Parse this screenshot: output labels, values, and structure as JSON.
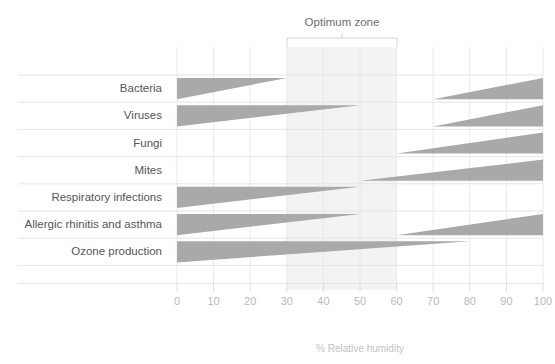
{
  "chart_data": {
    "type": "area",
    "title": "",
    "xlabel": "% Relative humidity",
    "ylabel": "",
    "xlim": [
      0,
      100
    ],
    "xticks": [
      0,
      10,
      20,
      30,
      40,
      50,
      60,
      70,
      80,
      90,
      100
    ],
    "xtick_labels": [
      "0",
      "10",
      "20",
      "30",
      "40",
      "50",
      "60",
      "70",
      "80",
      "90",
      "100"
    ],
    "grid": true,
    "legend": "none",
    "annotations": [
      {
        "name": "optimum-zone",
        "label": "Optimum zone",
        "x_start": 30,
        "x_end": 60,
        "shaded": true
      }
    ],
    "categories": [
      "Bacteria",
      "Viruses",
      "Fungi",
      "Mites",
      "Respiratory infections",
      "Allergic rhinitis and asthma",
      "Ozone production"
    ],
    "series": [
      {
        "name": "Bacteria",
        "bands": [
          {
            "from": 0,
            "to": 30,
            "thickness_from": 1.0,
            "thickness_to": 0.0,
            "side": "top"
          },
          {
            "from": 70,
            "to": 100,
            "thickness_from": 0.0,
            "thickness_to": 1.0,
            "side": "bottom"
          }
        ]
      },
      {
        "name": "Viruses",
        "bands": [
          {
            "from": 0,
            "to": 50,
            "thickness_from": 1.0,
            "thickness_to": 0.0,
            "side": "top"
          },
          {
            "from": 70,
            "to": 100,
            "thickness_from": 0.0,
            "thickness_to": 1.0,
            "side": "bottom"
          }
        ]
      },
      {
        "name": "Fungi",
        "bands": [
          {
            "from": 60,
            "to": 100,
            "thickness_from": 0.0,
            "thickness_to": 1.0,
            "side": "bottom"
          }
        ]
      },
      {
        "name": "Mites",
        "bands": [
          {
            "from": 50,
            "to": 100,
            "thickness_from": 0.0,
            "thickness_to": 1.0,
            "side": "bottom"
          }
        ]
      },
      {
        "name": "Respiratory infections",
        "bands": [
          {
            "from": 0,
            "to": 50,
            "thickness_from": 1.0,
            "thickness_to": 0.0,
            "side": "top"
          }
        ]
      },
      {
        "name": "Allergic rhinitis and asthma",
        "bands": [
          {
            "from": 0,
            "to": 50,
            "thickness_from": 1.0,
            "thickness_to": 0.0,
            "side": "top"
          },
          {
            "from": 60,
            "to": 100,
            "thickness_from": 0.0,
            "thickness_to": 1.0,
            "side": "bottom"
          }
        ]
      },
      {
        "name": "Ozone production",
        "bands": [
          {
            "from": 0,
            "to": 80,
            "thickness_from": 1.0,
            "thickness_to": 0.0,
            "side": "top"
          }
        ]
      }
    ]
  },
  "labels": {
    "row_0": "Bacteria",
    "row_1": "Viruses",
    "row_2": "Fungi",
    "row_3": "Mites",
    "row_4": "Respiratory infections",
    "row_5": "Allergic rhinitis and asthma",
    "row_6": "Ozone production"
  },
  "axis": {
    "title": "% Relative humidity",
    "ticks": [
      "0",
      "10",
      "20",
      "30",
      "40",
      "50",
      "60",
      "70",
      "80",
      "90",
      "100"
    ]
  },
  "zone": {
    "label": "Optimum zone",
    "range_start": "30",
    "range_end": "60"
  },
  "colors": {
    "wedge": "#a9a9a9",
    "zone_band": "#f3f3f3",
    "grid": "#e9e9e9",
    "row_line": "#e6e6e6",
    "label_text": "#555555",
    "tick_text": "#b9b9b9",
    "axis_title_text": "#c2c2c2",
    "zone_title_text": "#6e6e6e",
    "background": "#ffffff"
  }
}
